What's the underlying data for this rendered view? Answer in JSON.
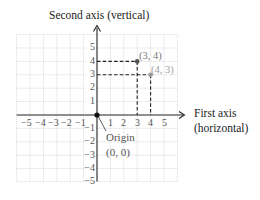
{
  "title_vertical": "Second axis (vertical)",
  "horizontal_label_line1": "First axis",
  "horizontal_label_line2": "(horizontal)",
  "origin_label_line1": "Origin",
  "origin_label_line2": "(0, 0)",
  "x_ticks": [
    "−5",
    "−4",
    "−3",
    "−2",
    "−1",
    "1",
    "2",
    "3",
    "4",
    "5"
  ],
  "y_ticks": [
    "5",
    "4",
    "3",
    "2",
    "1",
    "−1",
    "−2",
    "−3",
    "−4",
    "−5"
  ],
  "points": [
    {
      "label": "(3, 4)",
      "x": 3,
      "y": 4,
      "color": "#555555"
    },
    {
      "label": "(4, 3)",
      "x": 4,
      "y": 3,
      "color": "#9a9a9a"
    }
  ],
  "colors": {
    "grid": "#c8c8c8",
    "axis": "#222222",
    "dash": "#222222",
    "text": "#222222",
    "light_text": "#8a8a8a"
  }
}
